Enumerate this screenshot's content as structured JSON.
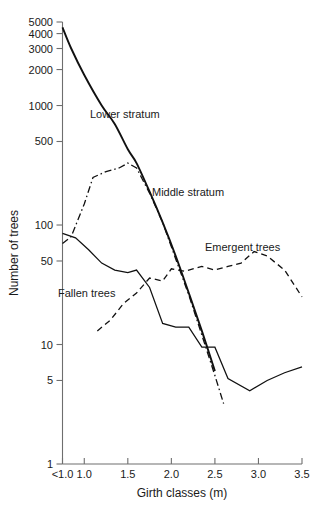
{
  "chart_data": {
    "type": "line",
    "title": "",
    "xlabel": "Girth classes (m)",
    "ylabel": "Number of trees",
    "yscale": "log",
    "ylim": [
      1,
      5000
    ],
    "xlim": [
      0.75,
      3.5
    ],
    "grid": false,
    "legend_position": "inline-annotations",
    "x_tick_labels": [
      "<1.0",
      "1.0",
      "1.5",
      "2.0",
      "2.5",
      "3.0",
      "3.5"
    ],
    "x_tick_values": [
      0.75,
      1.0,
      1.5,
      2.0,
      2.5,
      3.0,
      3.5
    ],
    "y_tick_labels": [
      "1",
      "5",
      "10",
      "50",
      "100",
      "500",
      "1000",
      "2000",
      "3000",
      "4000",
      "5000"
    ],
    "y_tick_values": [
      1,
      5,
      10,
      50,
      100,
      500,
      1000,
      2000,
      3000,
      4000,
      5000
    ],
    "series": [
      {
        "name": "Lower stratum",
        "style": "solid",
        "x": [
          0.75,
          0.85,
          1.0,
          1.2,
          1.35,
          1.5,
          1.6,
          1.75,
          1.9,
          2.05,
          2.2,
          2.35,
          2.5
        ],
        "values": [
          4500,
          3000,
          1800,
          1000,
          700,
          430,
          330,
          190,
          105,
          55,
          27,
          13,
          6
        ]
      },
      {
        "name": "Middle stratum",
        "style": "dash-dot",
        "x": [
          0.75,
          0.85,
          1.0,
          1.1,
          1.25,
          1.4,
          1.5,
          1.6,
          1.75,
          1.9,
          2.05,
          2.2,
          2.35,
          2.5,
          2.6
        ],
        "values": [
          70,
          80,
          150,
          250,
          280,
          300,
          330,
          300,
          185,
          105,
          52,
          26,
          12,
          5.5,
          3.2
        ]
      },
      {
        "name": "Fallen trees",
        "style": "solid-thin",
        "x": [
          0.75,
          0.9,
          1.05,
          1.2,
          1.35,
          1.5,
          1.6,
          1.75,
          1.9,
          2.05,
          2.2,
          2.35,
          2.5,
          2.65,
          2.9,
          3.1,
          3.3,
          3.5
        ],
        "values": [
          85,
          78,
          62,
          48,
          42,
          40,
          42,
          30,
          15,
          14,
          14,
          9.5,
          9.5,
          5.2,
          4.1,
          5.0,
          5.8,
          6.5
        ]
      },
      {
        "name": "Emergent trees",
        "style": "dashed",
        "x": [
          1.15,
          1.3,
          1.45,
          1.6,
          1.75,
          1.9,
          2.0,
          2.15,
          2.35,
          2.5,
          2.65,
          2.8,
          2.95,
          3.1,
          3.3,
          3.5
        ],
        "values": [
          13,
          16,
          22,
          27,
          36,
          34,
          43,
          41,
          45,
          42,
          45,
          48,
          60,
          55,
          42,
          25
        ]
      }
    ],
    "annotations": [
      {
        "text": "Lower stratum",
        "x_px": 90,
        "y_px": 118
      },
      {
        "text": "Middle stratum",
        "x_px": 152,
        "y_px": 196
      },
      {
        "text": "Emergent trees",
        "x_px": 205,
        "y_px": 251
      },
      {
        "text": "Fallen trees",
        "x_px": 58,
        "y_px": 297
      }
    ]
  },
  "colors": {
    "line": "#111111",
    "axis": "#6e6e6e",
    "text": "#1a1a1a",
    "background": "#ffffff"
  }
}
